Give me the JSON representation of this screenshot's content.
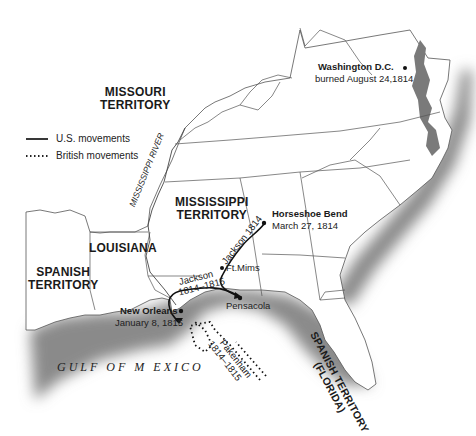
{
  "map": {
    "legend": [
      {
        "style": "solid",
        "label": "U.S. movements"
      },
      {
        "style": "dotted",
        "label": "British movements"
      }
    ],
    "regions": {
      "missouri": [
        "MISSOURI",
        "TERRITORY"
      ],
      "mississippi": [
        "MISSISSIPPI",
        "TERRITORY"
      ],
      "louisiana": "LOUISIANA",
      "spanish_west": [
        "SPANISH",
        "TERRITORY"
      ],
      "spanish_florida": [
        "SPANISH TERRITORY",
        "(FLORIDA)"
      ]
    },
    "river": "MISSISSIPPI RIVER",
    "water": "GULF OF M EXICO",
    "places": {
      "washington": {
        "name": "Washington D.C.",
        "note": "burned August 24,1814"
      },
      "horseshoe": {
        "name": "Horseshoe Bend",
        "note": "March 27, 1814"
      },
      "ftmims": {
        "name": "Ft.Mims"
      },
      "pensacola": {
        "name": "Pensacola"
      },
      "neworleans": {
        "name": "New Orleans",
        "note": "January 8, 1815"
      }
    },
    "routes": {
      "jackson1814": "Jackson 1814",
      "jackson1815": [
        "Jackson",
        "1814–1815"
      ],
      "pakenham": [
        "Pakenham",
        "1814–1815"
      ]
    }
  }
}
